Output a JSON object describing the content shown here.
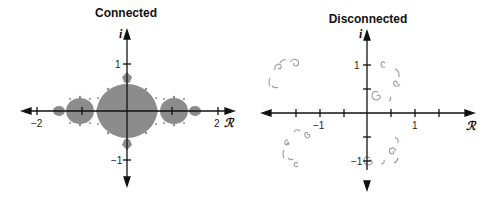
{
  "panels": [
    {
      "title": "Connected",
      "x_axis_label": "ℛ",
      "y_axis_label": "i",
      "x_tick_labels": [
        "−2",
        "2"
      ],
      "y_tick_labels": [
        "1",
        "−1"
      ],
      "fill_color": "#8c8c8c"
    },
    {
      "title": "Disconnected",
      "x_axis_label": "ℛ",
      "y_axis_label": "i",
      "x_tick_labels": [
        "−1",
        "1"
      ],
      "y_tick_labels": [
        "1",
        "−1"
      ],
      "curve_color": "#9a9a9a"
    }
  ],
  "colors": {
    "axis": "#111111",
    "filled_set": "#8c8c8c",
    "dust": "#9a9a9a"
  }
}
